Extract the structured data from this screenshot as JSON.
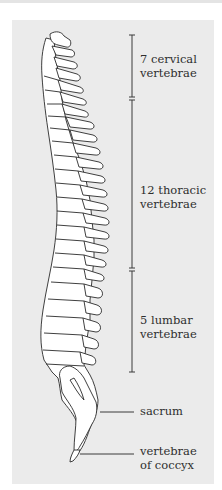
{
  "diagram": {
    "labels": {
      "cervical": {
        "line1": "7 cervical",
        "line2": "vertebrae"
      },
      "thoracic": {
        "line1": "12 thoracic",
        "line2": "vertebrae"
      },
      "lumbar": {
        "line1": "5 lumbar",
        "line2": "vertebrae"
      },
      "sacrum": {
        "line1": "sacrum"
      },
      "coccyx": {
        "line1": "vertebrae",
        "line2": "of coccyx"
      }
    },
    "colors": {
      "panel_background": "#ebebeb",
      "line": "#3a3a3a",
      "bone_fill": "#ffffff",
      "text": "#2e2e2e"
    }
  }
}
